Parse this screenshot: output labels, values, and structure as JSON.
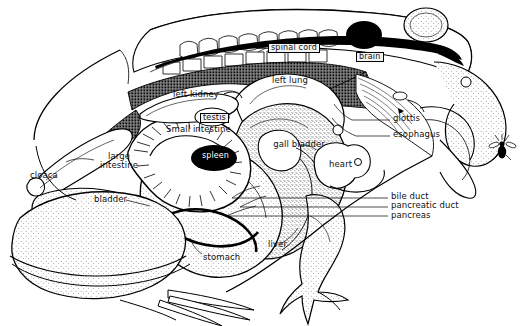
{
  "figure": {
    "view": "lateral dissection (left side)",
    "style": "black-and-white line drawing with stipple shading",
    "background_color": "#ffffff",
    "ink_color": "#000000"
  },
  "labels": [
    {
      "id": "spinal-cord",
      "text": "spinal cord",
      "style": "boxed",
      "x": 268,
      "y": 43
    },
    {
      "id": "brain",
      "text": "brain",
      "style": "boxed",
      "x": 356,
      "y": 52
    },
    {
      "id": "left-lung",
      "text": "left lung",
      "style": "plain",
      "x": 272,
      "y": 76
    },
    {
      "id": "left-kidney",
      "text": "left kidney",
      "style": "plain",
      "x": 173,
      "y": 90
    },
    {
      "id": "testis",
      "text": "testis",
      "style": "boxed",
      "x": 200,
      "y": 113
    },
    {
      "id": "small-intestine",
      "text": "Small intestine",
      "style": "plain",
      "x": 166,
      "y": 125
    },
    {
      "id": "glottis",
      "text": "glottis",
      "style": "plain",
      "x": 393,
      "y": 118
    },
    {
      "id": "esophagus",
      "text": "esophagus",
      "style": "plain",
      "x": 393,
      "y": 133
    },
    {
      "id": "spleen",
      "text": "spleen",
      "style": "ellipse",
      "x": 201,
      "y": 153
    },
    {
      "id": "gall-bladder",
      "text": "gall bladder",
      "style": "two-line",
      "x": 272,
      "y": 143
    },
    {
      "id": "heart",
      "text": "heart",
      "style": "plain",
      "x": 329,
      "y": 162
    },
    {
      "id": "large-intestine",
      "text": "large intestine",
      "style": "two-line",
      "x": 96,
      "y": 157
    },
    {
      "id": "cloaca",
      "text": "cloaca",
      "style": "plain",
      "x": 58,
      "y": 173
    },
    {
      "id": "bladder",
      "text": "bladder",
      "style": "plain",
      "x": 96,
      "y": 197
    },
    {
      "id": "bile-duct",
      "text": "bile duct",
      "style": "plain",
      "x": 391,
      "y": 194
    },
    {
      "id": "pancreatic-duct",
      "text": "pancreatic duct",
      "style": "plain",
      "x": 391,
      "y": 203
    },
    {
      "id": "pancreas",
      "text": "pancreas",
      "style": "plain",
      "x": 391,
      "y": 213
    },
    {
      "id": "liver",
      "text": "liver",
      "style": "plain",
      "x": 272,
      "y": 245
    },
    {
      "id": "stomach",
      "text": "stomach",
      "style": "plain",
      "x": 205,
      "y": 256
    }
  ],
  "structures": [
    "body outline",
    "vertebral column",
    "spinal cord",
    "brain",
    "eye",
    "left lung",
    "left kidney",
    "testis",
    "small intestine",
    "large intestine",
    "cloaca",
    "bladder",
    "spleen",
    "gall bladder",
    "heart",
    "liver",
    "stomach",
    "bile duct",
    "pancreatic duct",
    "pancreas",
    "glottis",
    "esophagus",
    "tongue",
    "fly",
    "hind leg",
    "fore leg"
  ]
}
